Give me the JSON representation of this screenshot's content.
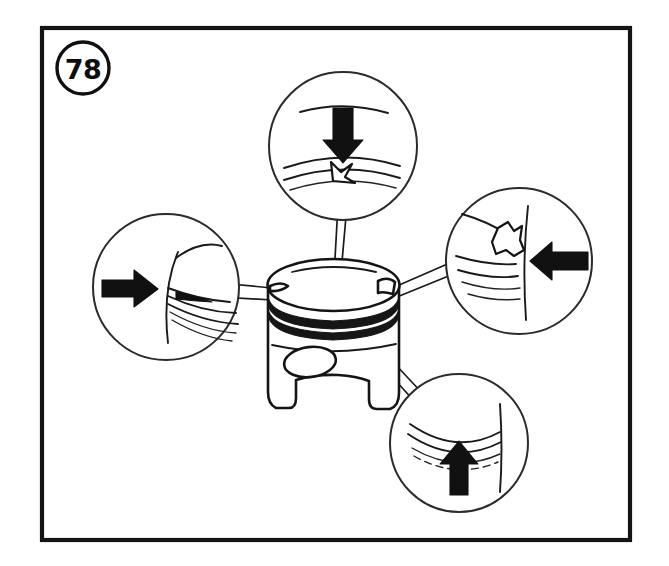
{
  "figure": {
    "number": "78",
    "badge_name": "figure-number-badge",
    "caption": "",
    "line_color": "#1a1a1a",
    "frame_color": "#141414",
    "background_color": "#ffffff"
  },
  "frame": {
    "x": 42,
    "y": 28,
    "width": 588,
    "height": 512
  },
  "subject": {
    "name": "piston",
    "label": "",
    "center_x": 333,
    "center_y": 330,
    "features": [
      "crown",
      "ring-groove-upper",
      "ring-groove-lower",
      "wrist-pin-boss",
      "skirt",
      "skirt-notch-left",
      "skirt-notch-right"
    ]
  },
  "callouts": [
    {
      "id": "top",
      "name": "callout-top",
      "cx": 343,
      "cy": 146,
      "r": 74,
      "arrow_direction": "down",
      "defect": "ring-land-nick",
      "label": ""
    },
    {
      "id": "left",
      "name": "callout-left",
      "cx": 166,
      "cy": 287,
      "r": 73,
      "arrow_direction": "right",
      "defect": "skirt-scoring",
      "label": ""
    },
    {
      "id": "right",
      "name": "callout-right",
      "cx": 519,
      "cy": 261,
      "r": 73,
      "arrow_direction": "left",
      "defect": "broken-ring-land",
      "label": ""
    },
    {
      "id": "bottom",
      "name": "callout-bottom",
      "cx": 459,
      "cy": 443,
      "r": 69,
      "arrow_direction": "up",
      "defect": "skirt-wear-lines",
      "label": ""
    }
  ]
}
